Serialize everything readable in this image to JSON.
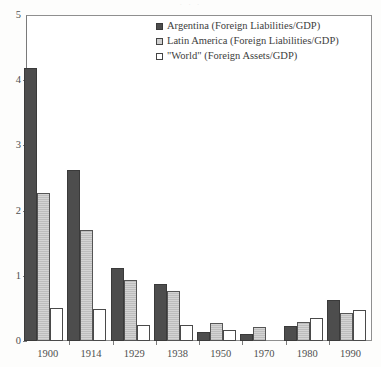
{
  "figure": {
    "scan_artifact_text": "· · ·"
  },
  "chart_data": {
    "type": "bar",
    "title": "",
    "subtitle": "",
    "xlabel": "",
    "ylabel": "",
    "categories": [
      "1900",
      "1914",
      "1929",
      "1938",
      "1950",
      "1970",
      "1980",
      "1990"
    ],
    "series": [
      {
        "name": "Argentina (Foreign Liabilities/GDP)",
        "swatch": "dark-filled-square",
        "color": "#4d4d4d",
        "values": [
          4.18,
          2.62,
          1.12,
          0.87,
          0.14,
          0.11,
          0.23,
          0.63
        ]
      },
      {
        "name": "Latin America (Foreign Liabilities/GDP)",
        "swatch": "gray-square",
        "color": "#d4d4d4",
        "values": [
          2.27,
          1.7,
          0.93,
          0.77,
          0.28,
          0.22,
          0.29,
          0.43
        ]
      },
      {
        "name": "\"World\" (Foreign Assets/GDP)",
        "swatch": "white-square",
        "color": "#ffffff",
        "values": [
          0.5,
          0.49,
          0.25,
          0.25,
          0.17,
          0.0,
          0.35,
          0.48
        ]
      }
    ],
    "ylim": [
      0,
      5
    ],
    "yticks": [
      0,
      1,
      2,
      3,
      4,
      5
    ],
    "ytick_labels": [
      "0",
      "1",
      "2",
      "3",
      "4",
      "5"
    ],
    "grid": false,
    "legend_position": "top-right",
    "legend_entries": [
      "Argentina (Foreign Liabilities/GDP)",
      "Latin America (Foreign Liabilities/GDP)",
      "\"World\" (Foreign Assets/GDP)"
    ]
  }
}
